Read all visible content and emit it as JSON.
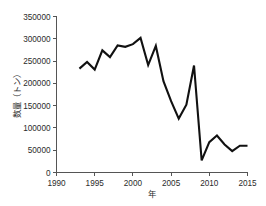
{
  "chart_data": {
    "type": "line",
    "title": "",
    "xlabel": "年",
    "ylabel": "数量（トン）",
    "xlim": [
      1990,
      2015
    ],
    "ylim": [
      0,
      350000
    ],
    "grid": false,
    "legend": null,
    "x_ticks": [
      "1990",
      "1995",
      "2000",
      "2005",
      "2010",
      "2015"
    ],
    "x_tick_values": [
      1990,
      1995,
      2000,
      2005,
      2010,
      2015
    ],
    "y_ticks": [
      "0",
      "50000",
      "100000",
      "150000",
      "200000",
      "250000",
      "300000",
      "350000"
    ],
    "y_tick_values": [
      0,
      50000,
      100000,
      150000,
      200000,
      250000,
      300000,
      350000
    ],
    "x": [
      1993,
      1994,
      1995,
      1996,
      1997,
      1998,
      1999,
      2000,
      2001,
      2002,
      2003,
      2004,
      2005,
      2006,
      2007,
      2008,
      2009,
      2010,
      2011,
      2012,
      2013,
      2014,
      2015
    ],
    "series": [
      {
        "name": "数量",
        "values": [
          233000,
          248000,
          231000,
          274000,
          259000,
          285000,
          282000,
          288000,
          302000,
          241000,
          284000,
          205000,
          160000,
          121000,
          152000,
          240000,
          27000,
          68000,
          83000,
          63000,
          48000,
          60000,
          60000
        ]
      }
    ]
  },
  "axis": {
    "y_unit_note": "トン",
    "x_unit_note": "年"
  }
}
